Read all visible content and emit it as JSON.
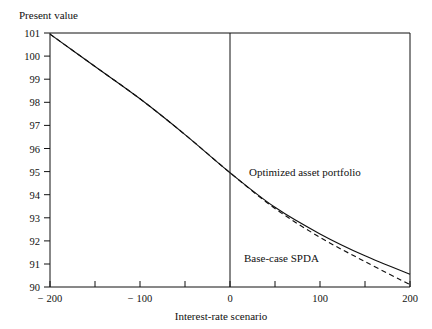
{
  "chart_data": {
    "type": "line",
    "title": "",
    "ylabel": "Present value",
    "xlabel": "Interest-rate scenario",
    "xlim": [
      -200,
      200
    ],
    "ylim": [
      90,
      101
    ],
    "grid": false,
    "legend_position": "inline-annotations",
    "x_ticks": [
      -200,
      -150,
      -100,
      -50,
      0,
      50,
      100,
      150,
      200
    ],
    "x_tick_labels": [
      "− 200",
      "",
      "− 100",
      "",
      "0",
      "",
      "100",
      "",
      "200"
    ],
    "y_ticks": [
      90,
      91,
      92,
      93,
      94,
      95,
      96,
      97,
      98,
      99,
      100,
      101
    ],
    "y_tick_labels": [
      "90",
      "91",
      "92",
      "93",
      "94",
      "95",
      "96",
      "97",
      "98",
      "99",
      "100",
      "101"
    ],
    "zero_reference_line_x": 0,
    "series": [
      {
        "name": "Optimized asset portfolio",
        "style": "solid",
        "x": [
          -200,
          -150,
          -100,
          -50,
          0,
          50,
          100,
          150,
          200
        ],
        "values": [
          100.95,
          99.55,
          98.15,
          96.6,
          94.95,
          93.45,
          92.3,
          91.35,
          90.55
        ]
      },
      {
        "name": "Base-case SPDA",
        "style": "dashed",
        "x": [
          -200,
          -150,
          -100,
          -50,
          0,
          50,
          100,
          150,
          200
        ],
        "values": [
          100.95,
          99.55,
          98.15,
          96.6,
          94.95,
          93.4,
          92.15,
          91.1,
          90.1
        ]
      }
    ],
    "annotations": [
      {
        "text": "Optimized asset portfolio",
        "x": 30,
        "y": 96.0
      },
      {
        "text": "Base-case SPDA",
        "x": 22,
        "y": 92.4
      }
    ]
  },
  "labels": {
    "y_axis_title": "Present value",
    "x_axis_title": "Interest-rate scenario",
    "series_optimized": "Optimized asset portfolio",
    "series_base_case": "Base-case SPDA",
    "y_101": "101",
    "y_100": "100",
    "y_99": "99",
    "y_98": "98",
    "y_97": "97",
    "y_96": "96",
    "y_95": "95",
    "y_94": "94",
    "y_93": "93",
    "y_92": "92",
    "y_91": "91",
    "y_90": "90",
    "x_neg200": "− 200",
    "x_neg100": "− 100",
    "x_zero": "0",
    "x_100": "100",
    "x_200": "200"
  },
  "colors": {
    "ink": "#111111",
    "paper": "#ffffff"
  }
}
